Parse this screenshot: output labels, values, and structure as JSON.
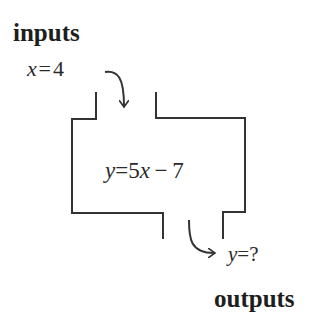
{
  "diagram": {
    "type": "function machine",
    "inputs_label": "inputs",
    "outputs_label": "outputs",
    "input": {
      "variable": "x",
      "equals": "=",
      "value": "4"
    },
    "rule": {
      "lhs": "y",
      "equals": "=",
      "coef": "5",
      "var": "x",
      "op": "−",
      "const": "7"
    },
    "output": {
      "variable": "y",
      "equals": "=",
      "value": "?"
    },
    "colors": {
      "stroke": "#333333",
      "text": "#222222",
      "background": "#ffffff"
    }
  }
}
